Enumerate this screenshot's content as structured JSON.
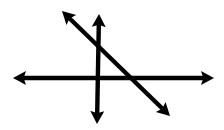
{
  "figure": {
    "title": "Three intersecting double-headed arrow lines",
    "width": 224,
    "height": 130,
    "background_color": "#ffffff",
    "stroke_color": "#000000",
    "stroke_width": 4,
    "arrow_head_length": 13,
    "arrow_head_half_width": 7,
    "intersection_point": {
      "x": 97,
      "y": 78
    },
    "lines": [
      {
        "name": "horizontal-line",
        "icon": "double-arrow-horizontal-icon",
        "orientation": "horizontal",
        "start": {
          "x": 13,
          "y": 78
        },
        "end": {
          "x": 214,
          "y": 78
        },
        "arrowheads": "both",
        "slope": 0
      },
      {
        "name": "vertical-line",
        "icon": "double-arrow-vertical-icon",
        "orientation": "vertical",
        "start": {
          "x": 99,
          "y": 14
        },
        "end": {
          "x": 97,
          "y": 124
        },
        "arrowheads": "both",
        "slope": "undefined"
      },
      {
        "name": "diagonal-line",
        "icon": "double-arrow-diagonal-icon",
        "orientation": "diagonal-negative",
        "start": {
          "x": 62,
          "y": 11
        },
        "end": {
          "x": 170,
          "y": 116
        },
        "arrowheads": "both",
        "slope": -0.97
      }
    ],
    "crossings": [
      {
        "name": "horizontal-vertical-crossing",
        "x": 97,
        "y": 78
      },
      {
        "name": "diagonal-vertical-crossing",
        "x": 98,
        "y": 46
      },
      {
        "name": "diagonal-horizontal-crossing",
        "x": 131,
        "y": 78
      }
    ]
  }
}
